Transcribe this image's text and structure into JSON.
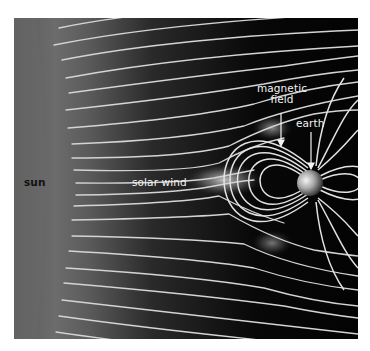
{
  "diagram": {
    "type": "solar wind and earth magnetosphere illustration",
    "labels": {
      "sun": "sun",
      "solar_wind": "solar wind",
      "magnetic_field_line1": "magnetic",
      "magnetic_field_line2": "field",
      "earth": "earth"
    },
    "colors": {
      "background": "#050505",
      "sun_gray": "#6e6e6e",
      "field_lines": "#d8d8d8",
      "label_text": "#f2f2f2",
      "sun_label_text": "#111111"
    }
  }
}
